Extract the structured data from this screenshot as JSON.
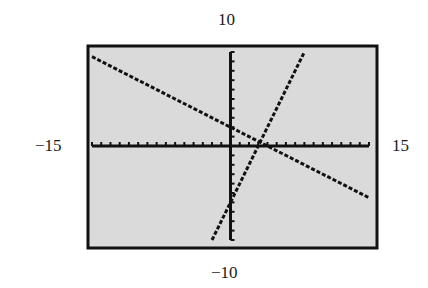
{
  "chart_data": {
    "type": "line",
    "title": "",
    "xlabel": "",
    "ylabel": "",
    "window": {
      "xmin": -15,
      "xmax": 15,
      "ymin": -10,
      "ymax": 10,
      "xscl": 1,
      "yscl": 1
    },
    "xlim": [
      -15,
      15
    ],
    "ylim": [
      -10,
      10
    ],
    "grid": false,
    "legend": null,
    "tick_labels": {
      "top": "10",
      "bottom": "−10",
      "left": "−15",
      "right": "15"
    },
    "series": [
      {
        "name": "line-1 (decreasing)",
        "equation": "y = -0.5x + 2",
        "slope": -0.5,
        "intercept": 2,
        "x": [
          -15,
          15
        ],
        "y": [
          9.5,
          -5.5
        ]
      },
      {
        "name": "line-2 (increasing)",
        "equation": "y = 2x - 6",
        "slope": 2,
        "intercept": -6,
        "x": [
          -2,
          8
        ],
        "y": [
          -10,
          10
        ]
      }
    ],
    "intersection": {
      "x": 3.2,
      "y": 0.4
    },
    "style": {
      "background": "#dcdcdc",
      "frame": "#111111",
      "line": "#111111",
      "dashed": true
    }
  },
  "labels": {
    "top": "10",
    "bottom": "−10",
    "left": "−15",
    "right": "15"
  }
}
